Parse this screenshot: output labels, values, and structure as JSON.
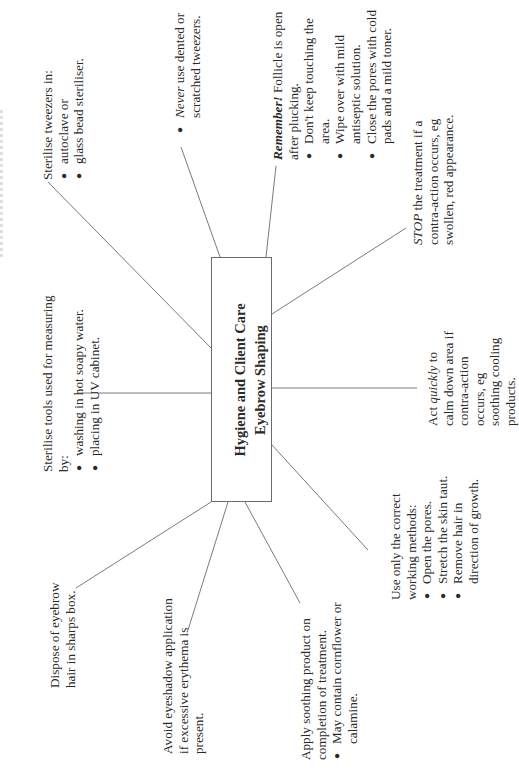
{
  "page": {
    "orientation": "rotated-90-ccw",
    "caption_partial": "(cut off at page edge)"
  },
  "colors": {
    "line": "#6b6b6b",
    "text": "#2a2a2a",
    "background": "#ffffff"
  },
  "center": {
    "title_line1": "Hygiene and Client Care",
    "title_line2": "Eyebrow Shaping"
  },
  "nodes": {
    "sterilise_tweezers": {
      "heading": "Sterilise tweezers in:",
      "bullets": [
        "autoclave or",
        "glass bead steriliser."
      ]
    },
    "never": {
      "bullet_em": "Never",
      "bullet_rest": " use dented or",
      "bullet_cont": "scratched tweezers."
    },
    "remember": {
      "heading_em": "Remember!",
      "heading_rest": " Follicle is open",
      "heading_cont": "after plucking.",
      "bullets": [
        {
          "text": "Don't keep touching the",
          "cont": "area."
        },
        {
          "text": "Wipe over with mild",
          "cont": "antiseptic solution."
        },
        {
          "text": "Close the pores with cold",
          "cont": "pads and a mild toner."
        }
      ]
    },
    "stop": {
      "em": "STOP",
      "line1_rest": " the treatment if a",
      "line2": "contra-action occurs, eg",
      "line3": "swollen, red appearance."
    },
    "act_quickly": {
      "pre": "Act ",
      "em": "quickly",
      "post": " to",
      "lines": [
        "calm down area if",
        "contra-action",
        "occurs, eg",
        "soothing cooling",
        "products."
      ]
    },
    "use_only": {
      "heading1": "Use only the correct",
      "heading2": "working methods:",
      "bullets": [
        {
          "text": "Open the pores.",
          "cont": ""
        },
        {
          "text": "Stretch the skin taut.",
          "cont": ""
        },
        {
          "text": "Remove hair in",
          "cont": "direction of growth."
        }
      ]
    },
    "apply_soothing": {
      "heading1": "Apply soothing product on",
      "heading2": "completion of treatment.",
      "bullets": [
        {
          "text": "May contain cornflower or",
          "cont": "calamine."
        }
      ]
    },
    "avoid_eyeshadow": {
      "lines": [
        "Avoid eyeshadow application",
        "if excessive erythema is",
        "present."
      ]
    },
    "dispose": {
      "lines": [
        "Dispose of eyebrow",
        "hair in sharps box."
      ]
    },
    "sterilise_tools": {
      "heading1": "Sterilise tools used for measuring",
      "heading2": "by:",
      "bullets": [
        "washing in hot soapy water.",
        "placing in UV cabinet."
      ]
    }
  },
  "bullet_glyph": "●"
}
